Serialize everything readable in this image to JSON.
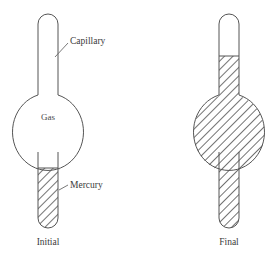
{
  "figure": {
    "background_color": "#ffffff",
    "outline_color": "#555555",
    "hatch_color": "#444444",
    "text_color": "#3a3a3a"
  },
  "annotations": {
    "capillary_label": "Capillary",
    "mercury_label": "Mercury",
    "gas_label": "Gas"
  },
  "captions": {
    "left": "Initial",
    "right": "Final"
  },
  "apparatus": [
    {
      "name": "initial",
      "caption": "Initial",
      "bulb_contents": "Gas",
      "mercury_regions": [
        "lower-stem"
      ],
      "empty_regions": [
        "upper-capillary",
        "bulb"
      ]
    },
    {
      "name": "final",
      "caption": "Final",
      "bulb_contents": "Mercury",
      "mercury_regions": [
        "lower-capillary",
        "bulb",
        "lower-stem"
      ],
      "empty_regions": [
        "upper-capillary"
      ]
    }
  ]
}
